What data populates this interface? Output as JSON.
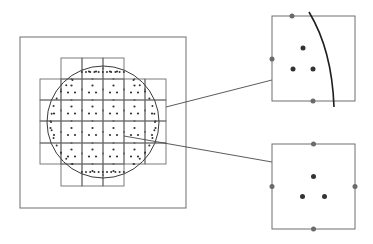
{
  "diagram": {
    "colors": {
      "background": "#ffffff",
      "line": "#6e6e6e",
      "dark_line": "#1e1e1e",
      "dot": "#333333",
      "pad": "#6a6a6a"
    },
    "outer_frame": {
      "x": 20,
      "y": 37,
      "w": 166,
      "h": 171
    },
    "wafer_circle": {
      "cx": 103,
      "cy": 122,
      "r": 56
    },
    "grid": {
      "cell": 21,
      "columns_x": [
        40,
        61,
        82,
        103,
        124,
        145,
        166
      ],
      "rows_y": [
        58,
        79,
        100,
        121,
        143,
        164,
        186
      ]
    },
    "callouts": [
      {
        "name": "edge-die",
        "x": 272,
        "y": 16,
        "w": 83,
        "h": 85,
        "has_wafer_edge": true
      },
      {
        "name": "interior-die",
        "x": 272,
        "y": 144,
        "w": 83,
        "h": 85,
        "has_wafer_edge": false
      }
    ],
    "connectors": [
      {
        "from": [
          166,
          107
        ],
        "to": [
          272,
          80
        ]
      },
      {
        "from": [
          124,
          136
        ],
        "to": [
          272,
          162
        ]
      }
    ]
  }
}
